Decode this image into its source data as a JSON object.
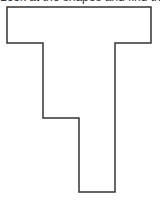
{
  "caption": {
    "text": "Look at the shapes and find the perimeter"
  },
  "shape": {
    "type": "rectilinear-polygon",
    "stroke_color": "#333333",
    "fill_color": "#ffffff",
    "stroke_width": 1.5,
    "points": "7,7 151,7 151,43 115,43 115,192 79,192 79,118 43,118 43,43 7,43"
  }
}
